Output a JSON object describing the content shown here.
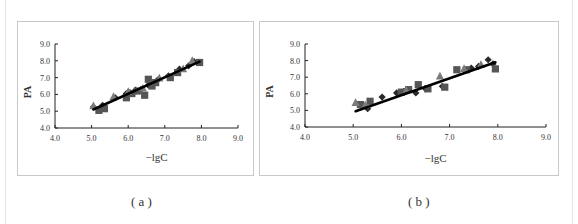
{
  "chart_data": [
    {
      "type": "scatter",
      "panel": "a",
      "caption": "( a )",
      "title": "",
      "xlabel": "−lgC",
      "ylabel": "PA",
      "xlim": [
        4.0,
        9.0
      ],
      "ylim": [
        4.0,
        9.0
      ],
      "xticks": [
        "4.0",
        "5.0",
        "6.0",
        "7.0",
        "8.0",
        "9.0"
      ],
      "yticks": [
        "4.0",
        "5.0",
        "6.0",
        "7.0",
        "8.0",
        "9.0"
      ],
      "grid": false,
      "legend": "none",
      "series": [
        {
          "name": "series-1",
          "marker": "diamond",
          "color": "#2a2a2a",
          "x": [
            5.05,
            5.3,
            5.65,
            5.95,
            6.05,
            6.2,
            6.35,
            6.55,
            6.8,
            7.1,
            7.4,
            7.65,
            7.8,
            7.95
          ],
          "y": [
            5.25,
            5.35,
            5.8,
            6.05,
            6.1,
            6.25,
            6.3,
            6.55,
            6.85,
            7.1,
            7.5,
            7.7,
            7.95,
            7.9
          ]
        },
        {
          "name": "series-2",
          "marker": "square",
          "color": "#555555",
          "x": [
            5.2,
            5.35,
            5.95,
            6.1,
            6.25,
            6.45,
            6.55,
            6.65,
            6.75,
            7.15,
            7.35,
            7.95
          ],
          "y": [
            5.05,
            5.15,
            5.8,
            6.05,
            6.2,
            5.95,
            6.9,
            6.5,
            6.7,
            7.0,
            7.3,
            7.9
          ]
        },
        {
          "name": "series-3",
          "marker": "triangle",
          "color": "#7a7a7a",
          "x": [
            5.05,
            5.6,
            6.0,
            6.4,
            6.85,
            7.5,
            7.75
          ],
          "y": [
            5.3,
            5.85,
            6.15,
            6.35,
            6.95,
            7.5,
            8.0
          ]
        }
      ],
      "fit_line": {
        "x": [
          5.05,
          7.95
        ],
        "y": [
          5.1,
          7.95
        ]
      }
    },
    {
      "type": "scatter",
      "panel": "b",
      "caption": "( b )",
      "title": "",
      "xlabel": "−lgC",
      "ylabel": "PA",
      "xlim": [
        4.0,
        9.0
      ],
      "ylim": [
        4.0,
        9.0
      ],
      "xticks": [
        "4.0",
        "5.0",
        "6.0",
        "7.0",
        "8.0",
        "9.0"
      ],
      "yticks": [
        "4.0",
        "5.0",
        "6.0",
        "7.0",
        "8.0",
        "9.0"
      ],
      "grid": false,
      "legend": "none",
      "series": [
        {
          "name": "series-1",
          "marker": "diamond",
          "color": "#2a2a2a",
          "x": [
            5.3,
            5.6,
            5.9,
            6.05,
            6.3,
            6.5,
            6.85,
            7.45,
            7.6,
            7.8,
            7.9
          ],
          "y": [
            5.1,
            5.8,
            6.05,
            6.15,
            6.05,
            6.3,
            6.45,
            7.55,
            7.65,
            8.05,
            7.8
          ]
        },
        {
          "name": "series-2",
          "marker": "square",
          "color": "#555555",
          "x": [
            5.15,
            5.35,
            6.0,
            6.15,
            6.35,
            6.55,
            6.9,
            7.15,
            7.35,
            7.95
          ],
          "y": [
            5.35,
            5.55,
            6.1,
            6.25,
            6.55,
            6.3,
            6.4,
            7.45,
            7.45,
            7.5
          ]
        },
        {
          "name": "series-3",
          "marker": "triangle",
          "color": "#7a7a7a",
          "x": [
            5.05,
            5.25,
            6.1,
            6.8,
            7.3,
            7.65
          ],
          "y": [
            5.45,
            5.3,
            6.2,
            7.05,
            7.5,
            7.75
          ]
        }
      ],
      "fit_line": {
        "x": [
          5.05,
          7.95
        ],
        "y": [
          4.95,
          7.9
        ]
      }
    }
  ]
}
